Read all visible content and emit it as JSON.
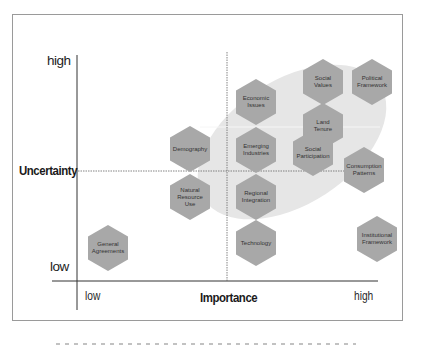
{
  "diagram": {
    "type": "scenario-matrix",
    "colors": {
      "hexagon_fill": "#a8a8a8",
      "ellipse_fill": "#e6e6e6",
      "axis_line": "#333333",
      "frame_border": "#9a9a9a",
      "dotted_line": "#666666"
    },
    "y_axis": {
      "title": "Uncertainty",
      "high_label": "high",
      "low_label": "low"
    },
    "x_axis": {
      "title": "Importance",
      "low_label": "low",
      "high_label": "high"
    },
    "factors": [
      {
        "id": "social-values",
        "lines": [
          "Social",
          "Values"
        ],
        "cx": 323,
        "cy": 82
      },
      {
        "id": "political-framework",
        "lines": [
          "Political",
          "Framework"
        ],
        "cx": 372,
        "cy": 82
      },
      {
        "id": "economic-issues",
        "lines": [
          "Economic",
          "Issues"
        ],
        "cx": 256,
        "cy": 102
      },
      {
        "id": "land-tenure",
        "lines": [
          "Land",
          "Tenure"
        ],
        "cx": 323,
        "cy": 126
      },
      {
        "id": "demography",
        "lines": [
          "Demography"
        ],
        "cx": 190,
        "cy": 149
      },
      {
        "id": "emerging-industries",
        "lines": [
          "Emerging",
          "Industries"
        ],
        "cx": 256,
        "cy": 150
      },
      {
        "id": "social-participation",
        "lines": [
          "Social",
          "Participation"
        ],
        "cx": 313,
        "cy": 153
      },
      {
        "id": "consumption-patterns",
        "lines": [
          "Consumption",
          "Patterns"
        ],
        "cx": 364,
        "cy": 170
      },
      {
        "id": "natural-resource-use",
        "lines": [
          "Natural",
          "Resource",
          "Use"
        ],
        "cx": 190,
        "cy": 197
      },
      {
        "id": "regional-integration",
        "lines": [
          "Regional",
          "Integration"
        ],
        "cx": 256,
        "cy": 197
      },
      {
        "id": "technology",
        "lines": [
          "Technology"
        ],
        "cx": 256,
        "cy": 243
      },
      {
        "id": "institutional-framework",
        "lines": [
          "Institutional",
          "Framework"
        ],
        "cx": 377,
        "cy": 239
      },
      {
        "id": "general-agreements",
        "lines": [
          "General",
          "Agreements"
        ],
        "cx": 108,
        "cy": 248
      }
    ]
  }
}
